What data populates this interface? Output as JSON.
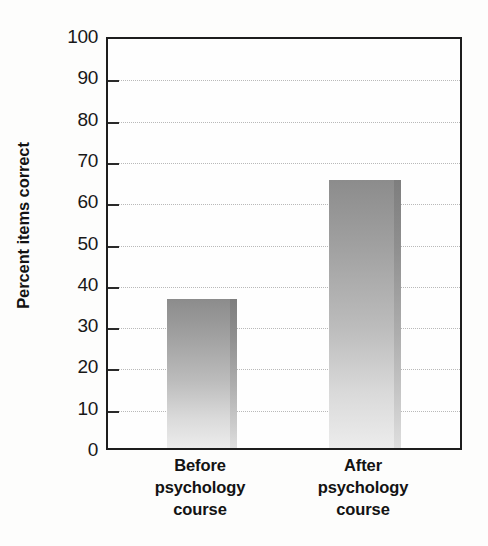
{
  "chart_data": {
    "type": "bar",
    "title": "",
    "xlabel": "",
    "ylabel": "Percent items correct",
    "categories": [
      "Before psychology course",
      "After psychology course"
    ],
    "category_lines": [
      [
        "Before",
        "psychology",
        "course"
      ],
      [
        "After",
        "psychology",
        "course"
      ]
    ],
    "values": [
      36,
      65
    ],
    "ylim": [
      0,
      100
    ],
    "ytick_labels": [
      "0",
      "10",
      "20",
      "30",
      "40",
      "50",
      "60",
      "70",
      "80",
      "90",
      "100"
    ],
    "ytick_values": [
      0,
      10,
      20,
      30,
      40,
      50,
      60,
      70,
      80,
      90,
      100
    ],
    "gridline_values": [
      10,
      20,
      30,
      40,
      50,
      60,
      70,
      80,
      90
    ],
    "grid": "horizontal-dotted",
    "legend": "none",
    "colors": {
      "bar_top": "#8c8c8c",
      "bar_bottom": "#ececec",
      "bar_edge": "#7e7e7e",
      "axis": "#1d1d1d",
      "gridline": "#b9b9b9",
      "text": "#131313",
      "background": "#fdfdfc"
    }
  }
}
